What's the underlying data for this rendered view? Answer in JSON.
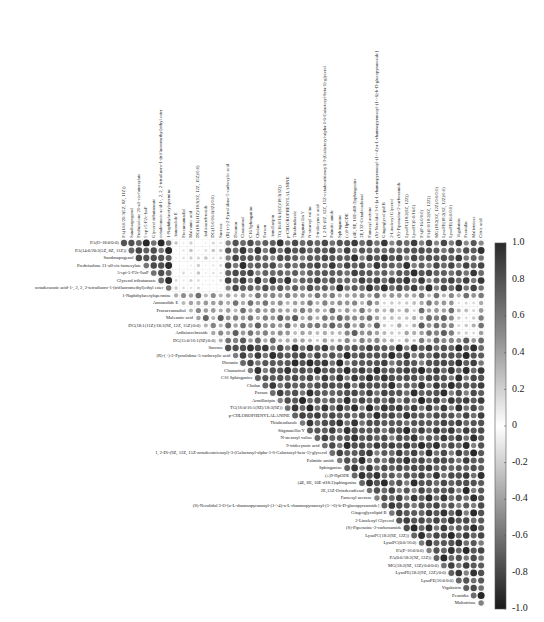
{
  "chart_data": {
    "type": "heatmap",
    "subtype": "correlation-upper-triangle-circles",
    "title": "",
    "row_labels": [
      "PA(O-18:0/0:0)",
      "PA(14:0/20:3(5Z, 8Z, 11Z))",
      "Sandosapogenol",
      "Prednisolone 21-all-cis-farnesylate",
      "5-epi-5-F2c-IsoP",
      "Glycerol tributanoate",
      "octadecanoic acid-1-, 2, 2, 2-tetrafluoro-1-(trifluoromethyl)ethyl ester",
      "1-Naphthylacetylspermine",
      "Annonolide E",
      "Procurcumadiol",
      "Maleamic acid",
      "DG(18:1(11Z)/18:3(9Z, 12Z, 15Z)/0:0)",
      "Ardisiacrebroside",
      "DG(15:0/16:1(9Z)/0:0)",
      "Sucrose",
      "(R)-(+)-2-Pyrrolidone-5-carboxylic acid",
      "Diosmin",
      "Clausarinol",
      "C16 Sphinganine",
      "Cholan",
      "Porson",
      "Armillaripin",
      "TG(16:0/16:1(9Z)/18:3(9Z))",
      "p-CHLOROPHENYLALANINE",
      "Thiabendazole",
      "Stigmatellin Y",
      "N-stearoyl valine",
      "9-tridecynoic acid",
      "1, 2-Di-(9Z, 12Z, 15Z-octadecatrienoyl)-3-(Galactosyl-alpha-1-6-Galactosyl-beta-1)-glycerol",
      "Palmitic amide",
      "Sphinganine",
      "(±)9-HpODE",
      "(4E, 8E, 10E-d18:3)sphingosine",
      "2E,13Z-Octadecadienal",
      "Farnesyl acetone",
      "(S)-Nerolidol 3-O-[a-L-rhamnopyranosyl-(1->4)-a-L-rhamnopyranosyl-(1->6)-b-D-glucopyranoside]",
      "Gingerglycolipid B",
      "2-Linoleoyl Glycerol",
      "(S)-Piperazine-2-carboxamide",
      "LysoPC(18:2(9Z, 12Z))",
      "LysoPC(0:0/16:0)",
      "PA(P-16:0/0:0)",
      "PA(0:0/18:2(9Z, 12Z))",
      "MG(18:2(9Z, 12Z)/0:0/0:0)",
      "LysoPE(18:2(9Z, 12Z)/0:0)",
      "LysoPE(16:0/0:0)",
      "Vigabatrin",
      "Peonidin",
      "Maltotriose"
    ],
    "column_labels_extra_last": "Citric acid",
    "column_labels_note": "Columns are row_labels[1..48] followed by 'Citric acid' (diagonal omitted)",
    "colorbar": {
      "ticks": [
        "1.0",
        "0.8",
        "0.6",
        "0.4",
        "0.2",
        "0",
        "-0.2",
        "-0.4",
        "-0.6",
        "-0.8",
        "-1.0"
      ],
      "range": [
        -1.0,
        1.0
      ],
      "colors": {
        "neg": "#1a1a1a",
        "mid": "#ffffff",
        "pos": "#2b2b2b"
      }
    },
    "value_rule": "approximate block structure read from image: rows 1-7 x cols 1-7 ~0.9, cols 8-14 ~0.15, others ~0.8; rows 8-14 moderate; rows 15+ mostly high",
    "blocks": [
      {
        "rows": [
          1,
          7
        ],
        "cols": [
          1,
          7
        ],
        "value": 0.92
      },
      {
        "rows": [
          1,
          7
        ],
        "cols": [
          8,
          14
        ],
        "value": 0.15
      },
      {
        "rows": [
          1,
          7
        ],
        "cols": [
          15,
          49
        ],
        "value": 0.85
      },
      {
        "rows": [
          8,
          10
        ],
        "cols": [
          8,
          49
        ],
        "value": 0.55
      },
      {
        "rows": [
          11,
          14
        ],
        "cols": [
          11,
          49
        ],
        "value": 0.65
      },
      {
        "rows": [
          15,
          49
        ],
        "cols": [
          15,
          49
        ],
        "value": 0.88
      }
    ],
    "light_patches": [
      {
        "rows": [
          9,
          14
        ],
        "cols": [
          36,
          40
        ],
        "value": 0.3
      },
      {
        "rows": [
          9,
          13
        ],
        "cols": [
          46,
          48
        ],
        "value": 0.25
      },
      {
        "rows": [
          13,
          14
        ],
        "cols": [
          23,
          30
        ],
        "value": 0.35
      }
    ]
  }
}
